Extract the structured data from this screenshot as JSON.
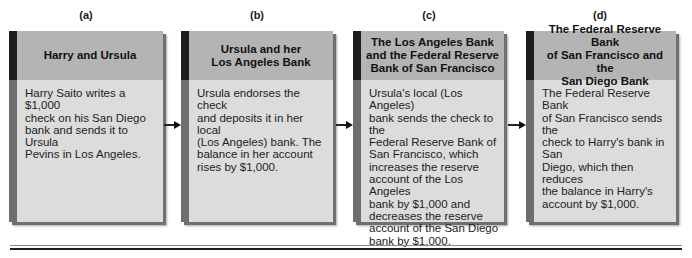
{
  "steps": [
    {
      "label": "(a)",
      "title": "Harry and Ursula",
      "body": "Harry Saito writes a $1,000\ncheck on his San Diego\nbank and sends it to Ursula\nPevins in Los Angeles."
    },
    {
      "label": "(b)",
      "title": "Ursula and her\nLos Angeles Bank",
      "body": "Ursula endorses the check\nand deposits it in her local\n(Los Angeles) bank. The\nbalance in her account\nrises by $1,000."
    },
    {
      "label": "(c)",
      "title": "The Los Angeles Bank\nand the Federal Reserve\nBank of San Francisco",
      "body": "Ursula's local (Los Angeles)\nbank sends the check to the\nFederal Reserve Bank of\nSan Francisco, which\nincreases the reserve\naccount of the Los Angeles\nbank by $1,000 and\ndecreases the reserve\naccount of the San Diego\nbank by $1,000."
    },
    {
      "label": "(d)",
      "title": "The Federal Reserve Bank\nof San Francisco and the\nSan Diego Bank",
      "body": "The Federal Reserve Bank\nof San Francisco sends the\ncheck to Harry's bank in San\nDiego, which then reduces\nthe balance in Harry's\naccount by $1,000."
    }
  ],
  "arrows": [
    {
      "from": "a",
      "to": "b"
    },
    {
      "from": "b",
      "to": "c"
    },
    {
      "from": "c",
      "to": "d"
    }
  ],
  "colors": {
    "card_body": "#dcdcdc",
    "card_header": "#b4b4b4",
    "stripe_dark": "#1c1c1c",
    "stripe_mid": "#6e6e6e"
  }
}
